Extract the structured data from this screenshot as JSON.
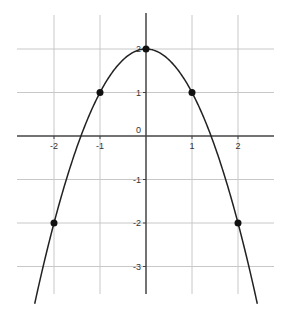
{
  "chart_data": {
    "type": "line",
    "title": "",
    "xlabel": "",
    "ylabel": "",
    "function": "y = 2 - x^2",
    "xlim": [
      -2.8,
      2.8
    ],
    "ylim": [
      -3.6,
      2.8
    ],
    "grid": true,
    "legend": null,
    "x_ticks": [
      -2,
      -1,
      1,
      2
    ],
    "y_ticks": [
      -3,
      -2,
      -1,
      1,
      2
    ],
    "origin_label": "0",
    "x_tick_labels": [
      "-2",
      "-1",
      "1",
      "2"
    ],
    "y_tick_labels": [
      "-3",
      "-2",
      "-1",
      "1",
      "2"
    ],
    "series": [
      {
        "name": "parabola",
        "type": "line",
        "x": [
          -2.4,
          -2,
          -1.5,
          -1,
          -0.5,
          0,
          0.5,
          1,
          1.5,
          2,
          2.4
        ],
        "values": [
          -3.76,
          -2,
          -0.25,
          1,
          1.75,
          2,
          1.75,
          1,
          -0.25,
          -2,
          -3.76
        ]
      },
      {
        "name": "marked points",
        "type": "scatter",
        "x": [
          -2,
          -1,
          0,
          1,
          2
        ],
        "values": [
          -2,
          1,
          2,
          1,
          -2
        ]
      }
    ]
  },
  "colors": {
    "grid": "#c8c8c8",
    "axis": "#444444",
    "curve": "#222222",
    "points": "#111111"
  }
}
